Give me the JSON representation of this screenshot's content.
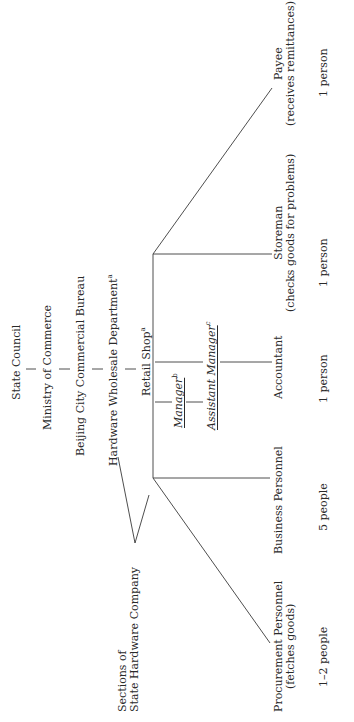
{
  "diagram": {
    "type": "organizational-chart",
    "orientation": "rotated-90-counterclockwise",
    "hierarchy": [
      {
        "label": "State Council",
        "sup": ""
      },
      {
        "label": "Ministry of Commerce",
        "sup": ""
      },
      {
        "label": "Beijing City Commercial Bureau",
        "sup": ""
      },
      {
        "label": "Hardware Wholesale Department",
        "sup": "a"
      },
      {
        "label": "Retail Shop",
        "sup": "a"
      }
    ],
    "side_unit": {
      "line1": "Sections of",
      "line2": "State Hardware Company"
    },
    "management": [
      {
        "label": "Manager",
        "sup": "b"
      },
      {
        "label": "Assistant Manager",
        "sup": "c"
      }
    ],
    "staff": [
      {
        "role": "Procurement Personnel",
        "note": "(fetches goods)",
        "count": "1–2 people"
      },
      {
        "role": "Business Personnel",
        "note": "",
        "count": "5 people"
      },
      {
        "role": "Accountant",
        "note": "",
        "count": "1 person"
      },
      {
        "role": "Storeman",
        "note": "(checks goods for problems)",
        "count": "1 person"
      },
      {
        "role": "Payee",
        "note": "(receives remittances)",
        "count": "1 person"
      }
    ],
    "line_color": "#3a3a3a"
  }
}
